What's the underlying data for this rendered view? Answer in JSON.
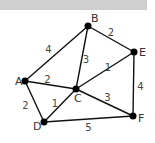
{
  "diagram": {
    "type": "weighted-graph",
    "colors": {
      "edge": "#111111",
      "node": "#000000",
      "text": "#333333",
      "bar": "#cfcfcf"
    },
    "nodes": [
      {
        "id": "A",
        "label": "A",
        "x": 25,
        "y": 81
      },
      {
        "id": "B",
        "label": "B",
        "x": 88,
        "y": 26
      },
      {
        "id": "C",
        "label": "C",
        "x": 76,
        "y": 89
      },
      {
        "id": "D",
        "label": "D",
        "x": 44,
        "y": 122
      },
      {
        "id": "E",
        "label": "E",
        "x": 134,
        "y": 52
      },
      {
        "id": "F",
        "label": "F",
        "x": 133,
        "y": 116
      }
    ],
    "edges": [
      {
        "from": "A",
        "to": "B",
        "weight": "4"
      },
      {
        "from": "B",
        "to": "E",
        "weight": "2"
      },
      {
        "from": "B",
        "to": "C",
        "weight": "3"
      },
      {
        "from": "A",
        "to": "C",
        "weight": "2"
      },
      {
        "from": "C",
        "to": "E",
        "weight": "1"
      },
      {
        "from": "E",
        "to": "F",
        "weight": "4"
      },
      {
        "from": "C",
        "to": "F",
        "weight": "3"
      },
      {
        "from": "A",
        "to": "D",
        "weight": "2"
      },
      {
        "from": "C",
        "to": "D",
        "weight": "1"
      },
      {
        "from": "D",
        "to": "F",
        "weight": "5"
      }
    ]
  }
}
